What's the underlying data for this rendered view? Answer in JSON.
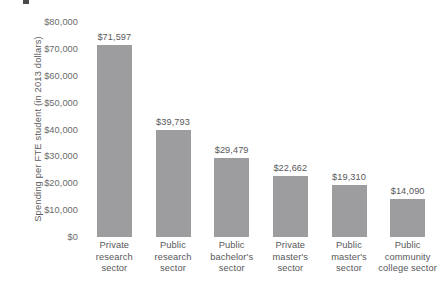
{
  "chart_data": {
    "type": "bar",
    "title": "",
    "xlabel": "",
    "ylabel": "Spending per FTE student (in 2013 dollars)",
    "ylim": [
      0,
      80000
    ],
    "grid": false,
    "legend": false,
    "bar_color": "#9d9d9f",
    "background_color": "#ffffff",
    "text_color": "#58585a",
    "ytick_labels": [
      "$80,000",
      "$70,000",
      "$60,000",
      "$50,000",
      "$40,000",
      "$30,000",
      "$20,000",
      "$10,000",
      "$0"
    ],
    "ytick_values": [
      80000,
      70000,
      60000,
      50000,
      40000,
      30000,
      20000,
      10000,
      0
    ],
    "categories": [
      "Private research sector",
      "Public research sector",
      "Public bachelor's sector",
      "Private master's sector",
      "Public master's sector",
      "Public community college sector"
    ],
    "category_lines": [
      [
        "Private",
        "research",
        "sector"
      ],
      [
        "Public",
        "research",
        "sector"
      ],
      [
        "Public",
        "bachelor's",
        "sector"
      ],
      [
        "Private",
        "master's",
        "sector"
      ],
      [
        "Public",
        "master's",
        "sector"
      ],
      [
        "Public",
        "community",
        "college sector"
      ]
    ],
    "values": [
      71597,
      39793,
      29479,
      22662,
      19310,
      14090
    ],
    "value_labels": [
      "$71,597",
      "$39,793",
      "$29,479",
      "$22,662",
      "$19,310",
      "$14,090"
    ]
  }
}
